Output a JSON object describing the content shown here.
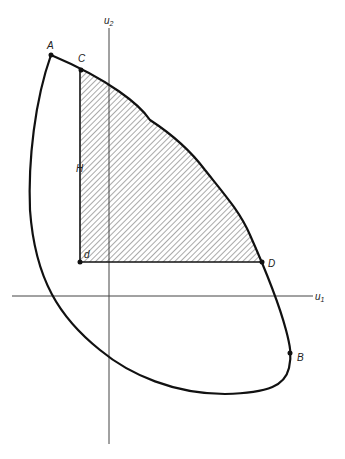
{
  "diagram": {
    "axes": {
      "x_label": "u",
      "x_sub": "1",
      "y_label": "u",
      "y_sub": "2"
    },
    "points": {
      "A": "A",
      "B": "B",
      "C": "C",
      "D": "D",
      "d": "d"
    },
    "region_label": "H",
    "colors": {
      "curve": "#111111",
      "axis": "#444444",
      "hatch": "#555555"
    }
  }
}
